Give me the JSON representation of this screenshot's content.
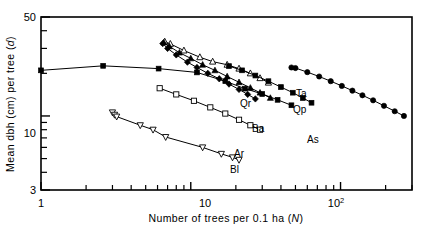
{
  "figure": {
    "title": "",
    "axes": {
      "x": {
        "label": "Number of trees per 0.1 ha (N)",
        "label_plain": "Number of trees per 0.1 ha",
        "label_symbol": "N",
        "scale": "log",
        "min": 1,
        "max": 300,
        "tick_labels": [
          "1",
          "10",
          "10"
        ],
        "tick_label_exponent": "2",
        "major_ticks": [
          1,
          10,
          100
        ],
        "minor_ticks": [
          2,
          3,
          4,
          5,
          6,
          7,
          8,
          9,
          20,
          30,
          40,
          50,
          60,
          70,
          80,
          90,
          200,
          300
        ]
      },
      "y": {
        "label": "Mean dbh (cm) per tree (d)",
        "label_plain": "Mean dbh (cm) per tree",
        "label_symbol": "d",
        "scale": "log",
        "min": 3,
        "max": 50,
        "tick_labels": [
          "50",
          "10",
          "3"
        ],
        "major_ticks": [
          3,
          10,
          50
        ],
        "minor_ticks": [
          4,
          5,
          6,
          7,
          8,
          9,
          20,
          30,
          40
        ]
      }
    },
    "series_labels": {
      "ta": "Ta",
      "qp": "Qp",
      "qr": "Qr",
      "ba": "Ba",
      "ar": "Ar",
      "bl": "Bl",
      "as": "As"
    }
  },
  "chart_data": {
    "type": "scatter",
    "title": "",
    "xlabel": "Number of trees per 0.1 ha (N)",
    "ylabel": "Mean dbh (cm) per tree (d)",
    "xscale": "log",
    "yscale": "log",
    "xlim": [
      1,
      300
    ],
    "ylim": [
      3,
      50
    ],
    "grid": false,
    "legend_position": "inline-annotations",
    "series": [
      {
        "name": "flat-upper",
        "label": "",
        "marker": "filled-square",
        "points": [
          [
            1.0,
            21.0
          ],
          [
            2.6,
            22.6
          ],
          [
            6.1,
            21.6
          ],
          [
            11.0,
            20.3
          ],
          [
            17.0,
            17.6
          ],
          [
            23.0,
            15.6
          ],
          [
            30.0,
            14.3
          ],
          [
            38.0,
            13.0
          ],
          [
            47.0,
            11.9
          ]
        ]
      },
      {
        "name": "Ta",
        "label": "Ta",
        "marker": "open-triangle-up",
        "points": [
          [
            6.7,
            33.5
          ],
          [
            7.3,
            32.3
          ],
          [
            9.0,
            29.0
          ],
          [
            11.5,
            26.0
          ],
          [
            14.0,
            24.2
          ],
          [
            17.5,
            23.0
          ],
          [
            21.0,
            21.6
          ],
          [
            25.0,
            20.0
          ],
          [
            29.0,
            18.5
          ],
          [
            33.0,
            17.2
          ]
        ]
      },
      {
        "name": "Qp",
        "label": "Qp",
        "marker": "filled-triangle-up",
        "points": [
          [
            6.6,
            33.0
          ],
          [
            7.2,
            31.0
          ],
          [
            8.4,
            28.0
          ],
          [
            10.0,
            25.5
          ],
          [
            12.0,
            23.0
          ],
          [
            14.5,
            21.0
          ],
          [
            17.5,
            19.0
          ],
          [
            21.0,
            17.3
          ],
          [
            25.0,
            15.8
          ],
          [
            29.0,
            14.6
          ],
          [
            34.0,
            13.4
          ]
        ]
      },
      {
        "name": "Qr",
        "label": "Qr",
        "marker": "filled-diamond",
        "points": [
          [
            6.5,
            32.5
          ],
          [
            7.0,
            30.0
          ],
          [
            8.0,
            27.0
          ],
          [
            9.5,
            24.0
          ],
          [
            11.0,
            22.0
          ],
          [
            13.0,
            20.0
          ],
          [
            15.5,
            18.3
          ],
          [
            18.0,
            16.8
          ],
          [
            21.0,
            15.4
          ],
          [
            24.0,
            14.2
          ],
          [
            27.0,
            13.2
          ]
        ]
      },
      {
        "name": "Ba",
        "label": "Ba",
        "marker": "filled-square",
        "points": [
          [
            18.0,
            22.5
          ],
          [
            22.0,
            21.0
          ],
          [
            27.0,
            19.3
          ],
          [
            33.0,
            17.6
          ],
          [
            40.0,
            16.0
          ],
          [
            48.0,
            14.6
          ],
          [
            56.0,
            13.4
          ],
          [
            64.0,
            12.4
          ]
        ]
      },
      {
        "name": "As",
        "label": "As",
        "marker": "filled-circle",
        "points": [
          [
            47.0,
            22.0
          ],
          [
            50.0,
            21.8
          ],
          [
            60.0,
            20.4
          ],
          [
            72.0,
            19.0
          ],
          [
            86.0,
            17.6
          ],
          [
            102.0,
            16.3
          ],
          [
            120.0,
            15.1
          ],
          [
            140.0,
            14.0
          ],
          [
            165.0,
            12.9
          ],
          [
            195.0,
            11.8
          ],
          [
            230.0,
            10.8
          ],
          [
            265.0,
            10.0
          ]
        ]
      },
      {
        "name": "Ar",
        "label": "Ar",
        "marker": "open-square",
        "points": [
          [
            6.2,
            15.7
          ],
          [
            8.0,
            14.2
          ],
          [
            10.5,
            12.8
          ],
          [
            13.5,
            11.5
          ],
          [
            17.0,
            10.4
          ],
          [
            21.0,
            9.4
          ],
          [
            25.0,
            8.6
          ],
          [
            29.0,
            8.0
          ]
        ]
      },
      {
        "name": "Bl",
        "label": "Bl",
        "marker": "open-triangle-down",
        "points": [
          [
            3.0,
            10.6
          ],
          [
            3.1,
            10.2
          ],
          [
            3.2,
            9.9
          ],
          [
            4.6,
            8.6
          ],
          [
            5.6,
            8.0
          ],
          [
            6.8,
            7.1
          ],
          [
            12.0,
            6.0
          ],
          [
            16.0,
            5.4
          ],
          [
            19.0,
            5.1
          ],
          [
            21.0,
            4.9
          ]
        ]
      }
    ]
  }
}
